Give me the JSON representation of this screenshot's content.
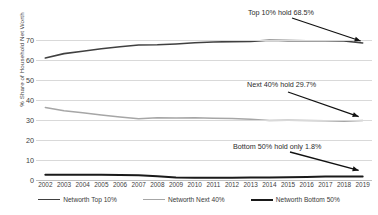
{
  "chart_data": {
    "type": "line",
    "title": "",
    "xlabel": "",
    "ylabel": "% Share of Household Net Worth",
    "ylim": [
      0,
      70
    ],
    "yticks": [
      0,
      10,
      20,
      30,
      40,
      50,
      60,
      70
    ],
    "grid": true,
    "legend_position": "bottom",
    "x": [
      2002,
      2003,
      2004,
      2005,
      2006,
      2007,
      2008,
      2009,
      2010,
      2011,
      2012,
      2013,
      2014,
      2015,
      2016,
      2017,
      2018,
      2019
    ],
    "categories": [
      "2002",
      "2003",
      "2004",
      "2005",
      "2006",
      "2007",
      "2008",
      "2009",
      "2010",
      "2011",
      "2012",
      "2013",
      "2014",
      "2015",
      "2016",
      "2017",
      "2018",
      "2019"
    ],
    "series": [
      {
        "name": "Networth Top 10%",
        "color": "#404040",
        "width": 1.6,
        "values": [
          61.0,
          63.2,
          64.4,
          65.6,
          66.6,
          67.5,
          67.6,
          68.0,
          68.6,
          69.0,
          69.2,
          69.3,
          69.9,
          69.7,
          69.6,
          69.6,
          69.5,
          68.5
        ]
      },
      {
        "name": "Networth Next 40%",
        "color": "#a6a6a6",
        "width": 1.5,
        "values": [
          36.3,
          34.6,
          33.6,
          32.5,
          31.5,
          30.6,
          31.1,
          31.0,
          31.1,
          30.9,
          30.8,
          30.4,
          29.8,
          29.9,
          29.8,
          29.6,
          29.4,
          29.7
        ]
      },
      {
        "name": "Networth Bottom 50%",
        "color": "#1a1a1a",
        "width": 2.0,
        "values": [
          2.6,
          2.6,
          2.6,
          2.6,
          2.5,
          2.4,
          1.9,
          1.3,
          1.1,
          1.1,
          1.1,
          1.2,
          1.3,
          1.4,
          1.5,
          1.7,
          1.8,
          1.8
        ]
      }
    ],
    "annotations": [
      {
        "text": "Top 10% hold 68.5%",
        "series": "Networth Top 10%",
        "value": 68.5
      },
      {
        "text": "Next 40% hold 29.7%",
        "series": "Networth Next 40%",
        "value": 29.7
      },
      {
        "text": "Bottom 50% hold only 1.8%",
        "series": "Networth Bottom 50%",
        "value": 1.8
      }
    ]
  },
  "axes": {
    "y_axis_title": "% Share of Household Net Worth",
    "y_tick_labels": [
      "70",
      "60",
      "50",
      "40",
      "30",
      "20",
      "10",
      "0"
    ],
    "x_tick_labels": [
      "2002",
      "2003",
      "2004",
      "2005",
      "2006",
      "2007",
      "2008",
      "2009",
      "2010",
      "2011",
      "2012",
      "2013",
      "2014",
      "2015",
      "2016",
      "2017",
      "2018",
      "2019"
    ]
  },
  "legend": {
    "items": [
      {
        "label": "Networth Top 10%",
        "color": "#404040",
        "thickness": "1.8px"
      },
      {
        "label": "Networth Next 40%",
        "color": "#a6a6a6",
        "thickness": "1.6px"
      },
      {
        "label": "Networth Bottom 50%",
        "color": "#1a1a1a",
        "thickness": "2.4px"
      }
    ]
  },
  "annotations": {
    "top": "Top 10% hold 68.5%",
    "next": "Next 40% hold 29.7%",
    "bottom": "Bottom 50% hold only 1.8%"
  },
  "colors": {
    "grid": "#d9d9d9",
    "axis": "#bfbfbf",
    "text": "#404040",
    "arrow": "#111111"
  }
}
